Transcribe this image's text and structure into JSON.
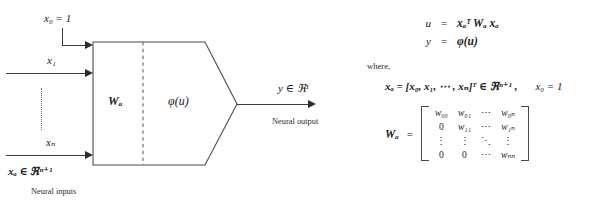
{
  "figure": {
    "diagram": {
      "bias_input_label": "x₀ = 1",
      "input_labels": [
        "x₁",
        "xₙ"
      ],
      "input_vertical_dots": "⋮",
      "block_left_label": "Wₐ",
      "block_right_label": "φ(u)",
      "output_label": "y ∈ ℜ¹",
      "input_space_label": "xₐ ∈ ℜⁿ⁺¹",
      "input_caption": "Neural inputs",
      "output_caption": "Neural output"
    },
    "equations": {
      "rows": [
        {
          "lhs": "u",
          "rel": "=",
          "rhs": "xₐᵀ Wₐ xₐ"
        },
        {
          "lhs": "y",
          "rel": "=",
          "rhs": "φ(u)"
        }
      ],
      "where_label": "where,",
      "vector_def": "xₐ = [x₀, x₁, ⋯ , xₙ]ᵀ ∈ ℜⁿ⁺¹ ,",
      "vector_constraint": "x₀ = 1",
      "matrix_label": "Wₐ",
      "matrix_equals": "=",
      "matrix_rows": [
        [
          "w₀₀",
          "w₀₁",
          "⋯",
          "w₀ₙ"
        ],
        [
          "0",
          "w₁₁",
          "⋯",
          "w₁ₙ"
        ],
        [
          "⋮",
          "⋮",
          "⋱",
          "⋮"
        ],
        [
          "0",
          "0",
          "⋯",
          "wₙₙ"
        ]
      ]
    },
    "colors": {
      "ink": "#202020",
      "line": "#3c3c3c",
      "dashed": "#7a7a7a",
      "background": "#ffffff"
    }
  }
}
